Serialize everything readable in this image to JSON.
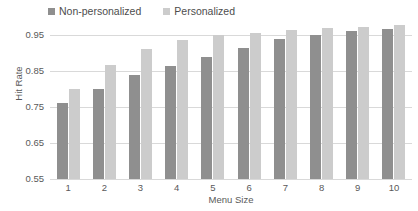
{
  "chart_data": {
    "type": "bar",
    "title": "",
    "xlabel": "Menu Size",
    "ylabel": "Hit Rate",
    "categories": [
      "1",
      "2",
      "3",
      "4",
      "5",
      "6",
      "7",
      "8",
      "9",
      "10"
    ],
    "ylim": [
      0.55,
      1.0
    ],
    "yticks": [
      0.95,
      0.85,
      0.75,
      0.65,
      0.55
    ],
    "ytick_labels": [
      "0.95",
      "0.85",
      "0.75",
      "0.65",
      "0.55"
    ],
    "grid": true,
    "legend_position": "top-left",
    "series": [
      {
        "name": "Non-personalized",
        "color": "#8f8f8f",
        "values": [
          0.76,
          0.8,
          0.84,
          0.865,
          0.89,
          0.915,
          0.94,
          0.95,
          0.96,
          0.968
        ]
      },
      {
        "name": "Personalized",
        "color": "#cccccc",
        "values": [
          0.8,
          0.868,
          0.91,
          0.935,
          0.95,
          0.956,
          0.965,
          0.97,
          0.973,
          0.978
        ]
      }
    ]
  }
}
